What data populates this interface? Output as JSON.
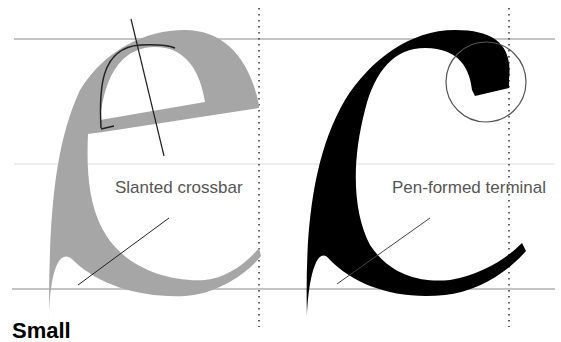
{
  "diagram": {
    "left": {
      "glyph": "e",
      "label": "Slanted crossbar",
      "fill": "#a6a6a6"
    },
    "right": {
      "glyph": "c",
      "label": "Pen-formed terminal",
      "fill": "#000000"
    },
    "guide_color": "#888888",
    "footer_partial": "Small"
  }
}
